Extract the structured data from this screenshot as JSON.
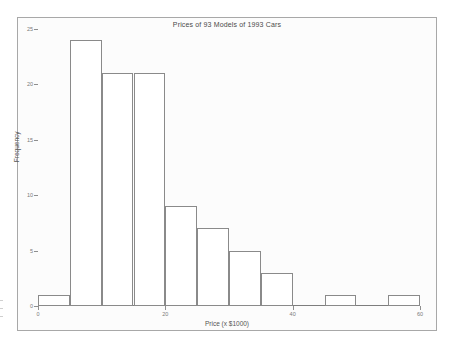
{
  "chart_data": {
    "type": "bar",
    "title": "Prices of 93 Models of 1993 Cars",
    "xlabel": "Price (x $1000)",
    "ylabel": "Frequency",
    "categories": [
      "0-5",
      "5-10",
      "10-15",
      "15-20",
      "20-25",
      "25-30",
      "30-35",
      "35-40",
      "40-45",
      "45-50",
      "50-55",
      "55-60"
    ],
    "bin_starts": [
      0,
      5,
      10,
      15,
      20,
      25,
      30,
      35,
      40,
      45,
      50,
      55
    ],
    "bin_width": 5,
    "values": [
      1,
      24,
      21,
      21,
      9,
      7,
      5,
      3,
      0,
      1,
      0,
      1
    ],
    "xlim": [
      0,
      60
    ],
    "ylim": [
      0,
      25
    ],
    "xticks": [
      0,
      20,
      40,
      60
    ],
    "xtick_labels": [
      "0",
      "20",
      "40",
      "60"
    ],
    "yticks": [
      0,
      5,
      10,
      15,
      20,
      25
    ],
    "ytick_labels": [
      "0",
      "5",
      "10",
      "15",
      "20",
      "25"
    ],
    "grid": false,
    "legend": null,
    "bar_fill_color": "#ffffff",
    "bar_border_color": "#8a8a8a",
    "background_color": "#fcfcfc",
    "frame_color": "#a8a8a8",
    "total_observations": 93
  }
}
